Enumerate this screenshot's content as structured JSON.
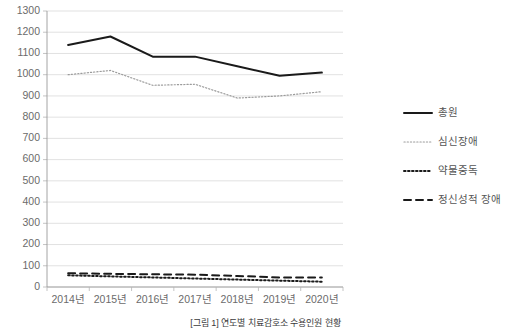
{
  "chart_data": {
    "type": "line",
    "title": "",
    "xlabel": "",
    "ylabel": "",
    "categories": [
      "2014년",
      "2015년",
      "2016년",
      "2017년",
      "2018년",
      "2019년",
      "2020년"
    ],
    "ylim": [
      0,
      1300
    ],
    "ytick_step": 100,
    "yticks": [
      0,
      100,
      200,
      300,
      400,
      500,
      600,
      700,
      800,
      900,
      1000,
      1100,
      1200,
      1300
    ],
    "ytick_labels": [
      "0",
      "100",
      "200",
      "300",
      "400",
      "500",
      "600",
      "700",
      "800",
      "900",
      "1000",
      "1100",
      "1200",
      "1300"
    ],
    "grid": true,
    "legend_position": "right",
    "series": [
      {
        "name": "총원",
        "style": "solid",
        "color": "#1a1a1a",
        "width": 2.0,
        "values": [
          1140,
          1180,
          1085,
          1085,
          1040,
          995,
          1010
        ]
      },
      {
        "name": "심신장애",
        "style": "dotted-light",
        "color": "#9b9b9b",
        "width": 1.2,
        "values": [
          1000,
          1020,
          950,
          955,
          890,
          900,
          920
        ]
      },
      {
        "name": "약물중독",
        "style": "dotted-bold",
        "color": "#1a1a1a",
        "width": 2.0,
        "values": [
          55,
          50,
          45,
          40,
          35,
          30,
          25
        ]
      },
      {
        "name": "정신성적 장애",
        "style": "dashed",
        "color": "#1a1a1a",
        "width": 2.0,
        "values": [
          65,
          62,
          60,
          58,
          52,
          45,
          45
        ]
      }
    ]
  },
  "legend": {
    "items": [
      {
        "label": "총원"
      },
      {
        "label": "심신장애"
      },
      {
        "label": "약물중독"
      },
      {
        "label": "정신성적 장애"
      }
    ]
  },
  "caption": {
    "text": "[그림 1] 연도별 치료감호소 수용인원 현황"
  }
}
